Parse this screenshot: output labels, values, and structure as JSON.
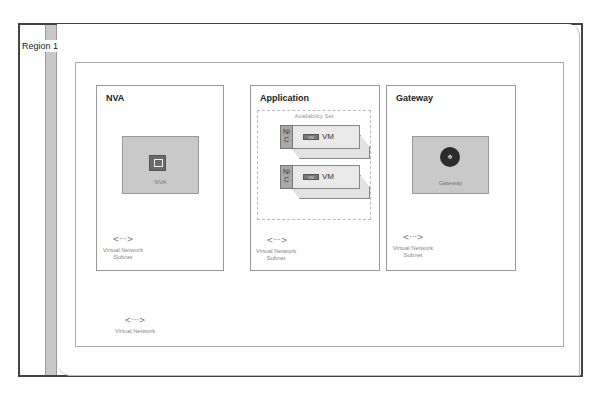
{
  "region": {
    "label": "Region 1"
  },
  "virtual_network": {
    "label": "Virtual Network",
    "icon": "vnet-icon"
  },
  "subnets": [
    {
      "title": "NVA",
      "card_label": "NVA",
      "icon": "nva-appliance-icon",
      "footer": [
        "Virtual Network",
        "Subnet"
      ]
    },
    {
      "title": "Application",
      "availability_set_label": "Availability Set",
      "vms": [
        {
          "nic_label": [
            "NI",
            "C"
          ],
          "tag": "VM",
          "vm_label": "VM"
        },
        {
          "nic_label": [
            "NI",
            "C"
          ],
          "tag": "VM",
          "vm_label": "VM"
        }
      ],
      "footer": [
        "Virtual Network",
        "Subnet"
      ]
    },
    {
      "title": "Gateway",
      "card_label": "Gateway",
      "icon": "gateway-router-icon",
      "footer": [
        "Virtual Network",
        "Subnet"
      ]
    }
  ],
  "vnet_glyph": "<···>",
  "gw_glyph": "✥"
}
